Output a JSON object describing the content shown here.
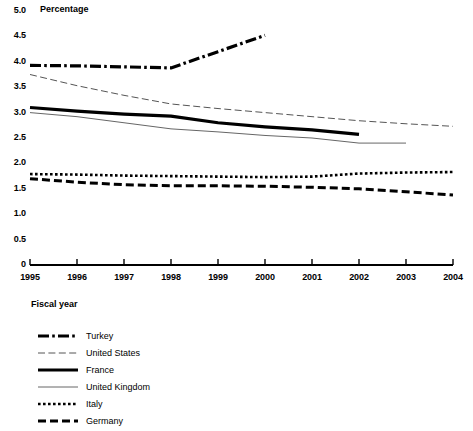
{
  "chart_data": {
    "type": "line",
    "title": "",
    "ylabel": "Percentage",
    "xlabel": "Fiscal year",
    "grid": false,
    "legend_position": "bottom-left",
    "ylim": [
      0,
      5.0
    ],
    "xlim": [
      1995,
      2004
    ],
    "y_ticks": [
      "5.0",
      "4.5",
      "4.0",
      "3.5",
      "3.0",
      "2.5",
      "2.0",
      "1.5",
      "1.0",
      "0.5",
      "0"
    ],
    "y_tick_values": [
      5.0,
      4.5,
      4.0,
      3.5,
      3.0,
      2.5,
      2.0,
      1.5,
      1.0,
      0.5,
      0
    ],
    "x_ticks": [
      "1995",
      "1996",
      "1997",
      "1998",
      "1999",
      "2000",
      "2001",
      "2002",
      "2003",
      "2004"
    ],
    "categories": [
      1995,
      1996,
      1997,
      1998,
      1999,
      2000,
      2001,
      2002,
      2003,
      2004
    ],
    "series": [
      {
        "name": "Turkey",
        "style": "dash-dot-thick",
        "x": [
          1995,
          1996,
          1997,
          1998,
          1999,
          2000
        ],
        "values": [
          3.93,
          3.92,
          3.9,
          3.88,
          4.2,
          4.52
        ]
      },
      {
        "name": "United States",
        "style": "dashed-thin",
        "x": [
          1995,
          1996,
          1997,
          1998,
          1999,
          2000,
          2001,
          2002,
          2003,
          2004
        ],
        "values": [
          3.75,
          3.53,
          3.34,
          3.17,
          3.08,
          3.0,
          2.92,
          2.84,
          2.78,
          2.73
        ]
      },
      {
        "name": "France",
        "style": "solid-thick",
        "x": [
          1995,
          1996,
          1997,
          1998,
          1999,
          2000,
          2001,
          2002
        ],
        "values": [
          3.1,
          3.03,
          2.97,
          2.93,
          2.8,
          2.72,
          2.66,
          2.57
        ]
      },
      {
        "name": "United Kingdom",
        "style": "solid-thin",
        "x": [
          1995,
          1996,
          1997,
          1998,
          1999,
          2000,
          2001,
          2002,
          2003
        ],
        "values": [
          3.0,
          2.92,
          2.8,
          2.68,
          2.62,
          2.55,
          2.5,
          2.4,
          2.4
        ]
      },
      {
        "name": "Italy",
        "style": "dotted-thick",
        "x": [
          1995,
          1996,
          1997,
          1998,
          1999,
          2000,
          2001,
          2002,
          2003,
          2004
        ],
        "values": [
          1.79,
          1.78,
          1.76,
          1.75,
          1.74,
          1.73,
          1.74,
          1.8,
          1.82,
          1.83
        ]
      },
      {
        "name": "Germany",
        "style": "dashed-thick",
        "x": [
          1995,
          1996,
          1997,
          1998,
          1999,
          2000,
          2001,
          2002,
          2003,
          2004
        ],
        "values": [
          1.7,
          1.63,
          1.58,
          1.56,
          1.56,
          1.55,
          1.53,
          1.5,
          1.44,
          1.38
        ]
      }
    ]
  },
  "axis": {
    "y_title": "Percentage",
    "x_title": "Fiscal year",
    "y_labels": [
      "5.0",
      "4.5",
      "4.0",
      "3.5",
      "3.0",
      "2.5",
      "2.0",
      "1.5",
      "1.0",
      "0.5",
      "0"
    ],
    "x_labels": [
      "1995",
      "1996",
      "1997",
      "1998",
      "1999",
      "2000",
      "2001",
      "2002",
      "2003",
      "2004"
    ]
  },
  "legend": {
    "items": [
      {
        "label": "Turkey",
        "style": "dash-dot-thick"
      },
      {
        "label": "United States",
        "style": "dashed-thin"
      },
      {
        "label": "France",
        "style": "solid-thick"
      },
      {
        "label": "United Kingdom",
        "style": "solid-thin"
      },
      {
        "label": "Italy",
        "style": "dotted-thick"
      },
      {
        "label": "Germany",
        "style": "dashed-thick"
      }
    ]
  },
  "colors": {
    "line": "#000000",
    "thin_line": "#4d4d4d",
    "background": "#ffffff"
  }
}
